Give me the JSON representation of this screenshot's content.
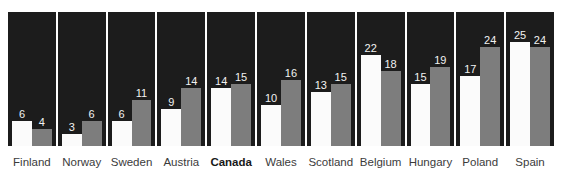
{
  "chart_data": {
    "type": "bar",
    "title": "",
    "subtitle": "",
    "xlabel": "",
    "ylabel": "",
    "ylim": [
      0,
      28
    ],
    "grid": false,
    "legend_position": "none",
    "categories": [
      "Finland",
      "Norway",
      "Sweden",
      "Austria",
      "Canada",
      "Wales",
      "Scotland",
      "Belgium",
      "Hungary",
      "Poland",
      "Spain"
    ],
    "highlighted_category": "Canada",
    "series": [
      {
        "name": "series-a",
        "color": "#fbfbfb",
        "values": [
          6,
          3,
          6,
          9,
          14,
          10,
          13,
          22,
          15,
          17,
          25
        ]
      },
      {
        "name": "series-b",
        "color": "#7d7d7d",
        "values": [
          4,
          6,
          11,
          14,
          15,
          16,
          15,
          18,
          19,
          24,
          24
        ]
      }
    ]
  },
  "style": {
    "panel_background": "#1c1c1c",
    "page_background": "#ffffff",
    "label_color": "#3b3b3b",
    "value_color": "#f2f2f2"
  }
}
